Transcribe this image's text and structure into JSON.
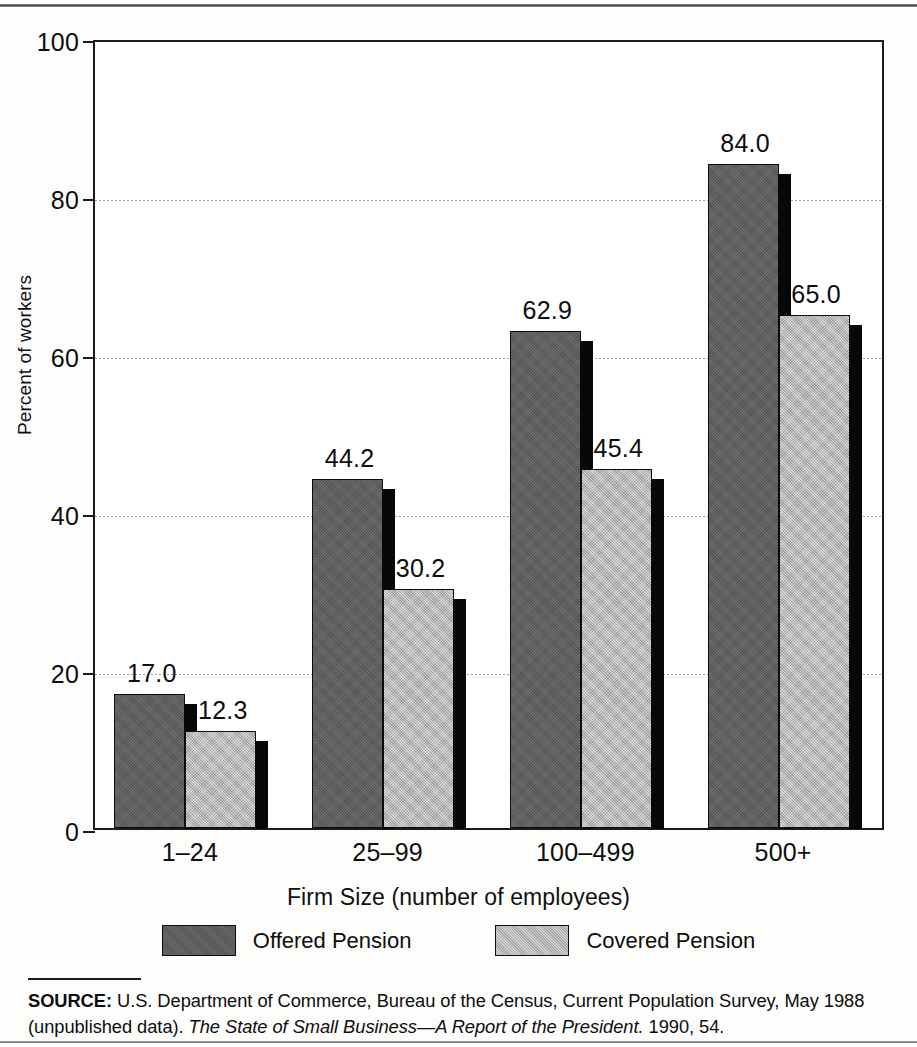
{
  "chart_data": {
    "type": "bar",
    "title": "",
    "categories": [
      "1–24",
      "25–99",
      "100–499",
      "500+"
    ],
    "series": [
      {
        "name": "Offered Pension",
        "color": "#5d5d5d",
        "values": [
          17.0,
          44.2,
          62.9,
          84.0
        ],
        "labels": [
          "17.0",
          "44.2",
          "62.9",
          "84.0"
        ]
      },
      {
        "name": "Covered Pension",
        "color": "#bdbdbd",
        "values": [
          12.3,
          30.2,
          45.4,
          65.0
        ],
        "labels": [
          "12.3",
          "30.2",
          "45.4",
          "65.0"
        ]
      }
    ],
    "xlabel": "Firm Size (number of employees)",
    "ylabel": "Percent of workers",
    "ylim": [
      0,
      100
    ],
    "yticks": [
      0,
      20,
      40,
      60,
      80,
      100
    ],
    "ytick_labels": [
      "0",
      "20",
      "40",
      "60",
      "80",
      "100"
    ],
    "grid": true,
    "legend_position": "bottom"
  },
  "axes": {
    "y_title": "Percent of workers",
    "x_title": "Firm Size (number of employees)"
  },
  "legend": {
    "items": [
      {
        "label": "Offered Pension"
      },
      {
        "label": "Covered Pension"
      }
    ]
  },
  "source": {
    "label": "SOURCE:",
    "body_part1": " U.S. Department of Commerce, Bureau of the Census, Current Population Survey, May 1988 (unpublished data). ",
    "italic_part": "The State of Small Business—A Report of the President.",
    "body_part2": " 1990, 54."
  }
}
